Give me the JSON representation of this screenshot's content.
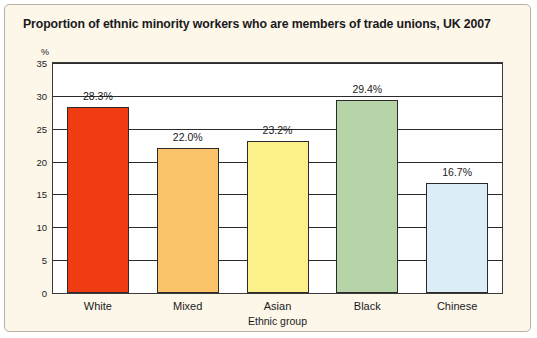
{
  "chart_data": {
    "type": "bar",
    "title": "Proportion of ethnic minority workers who are members of trade unions, UK 2007",
    "xlabel": "Ethnic group",
    "ylabel": "%",
    "ylim": [
      0,
      35
    ],
    "yticks": [
      0,
      5,
      10,
      15,
      20,
      25,
      30,
      35
    ],
    "grid": true,
    "legend": "none",
    "categories": [
      "White",
      "Mixed",
      "Asian",
      "Black",
      "Chinese"
    ],
    "values": [
      28.3,
      22.0,
      23.2,
      29.4,
      16.7
    ],
    "data_labels": [
      "28.3%",
      "22.0%",
      "23.2%",
      "29.4%",
      "16.7%"
    ],
    "colors": [
      "#f03c12",
      "#fcc46a",
      "#fbf08a",
      "#b6d4a8",
      "#dbeef7"
    ]
  }
}
